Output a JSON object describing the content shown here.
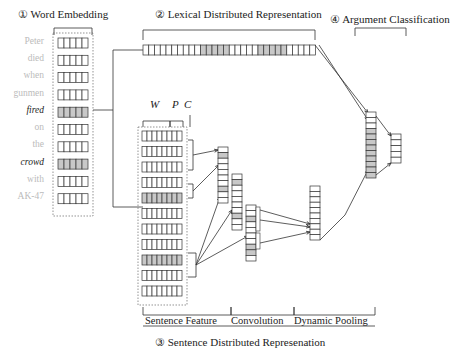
{
  "titles": {
    "word_embedding": "① Word Embedding",
    "lexical": "② Lexical Distributed Representation",
    "sentence": "③ Sentence Distributed Represenation",
    "argument": "④ Argument Classification"
  },
  "words": [
    {
      "text": "Peter",
      "highlight": false
    },
    {
      "text": "died",
      "highlight": false
    },
    {
      "text": "when",
      "highlight": false
    },
    {
      "text": "gunmen",
      "highlight": false
    },
    {
      "text": "fired",
      "highlight": true
    },
    {
      "text": "on",
      "highlight": false
    },
    {
      "text": "the",
      "highlight": false
    },
    {
      "text": "crowd",
      "highlight": true
    },
    {
      "text": "with",
      "highlight": false
    },
    {
      "text": "AK-47",
      "highlight": false
    }
  ],
  "feature_labels": {
    "w": "W",
    "p": "P",
    "c": "C"
  },
  "sections": {
    "sentence_feature": "Sentence Feature",
    "convolution": "Convolution",
    "dynamic_pooling": "Dynamic Pooling"
  },
  "colors": {
    "shade": "#c8c8c8",
    "line": "#333333",
    "dotted": "#666666",
    "faint_word": "#bbbbbb"
  }
}
